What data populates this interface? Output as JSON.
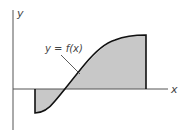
{
  "diagram": {
    "y_axis_label": "y",
    "x_axis_label": "x",
    "curve_label": "y = f(x)",
    "fill_color": "#c8c8c8",
    "curve_color": "#111111",
    "axis_color": "#555555"
  }
}
